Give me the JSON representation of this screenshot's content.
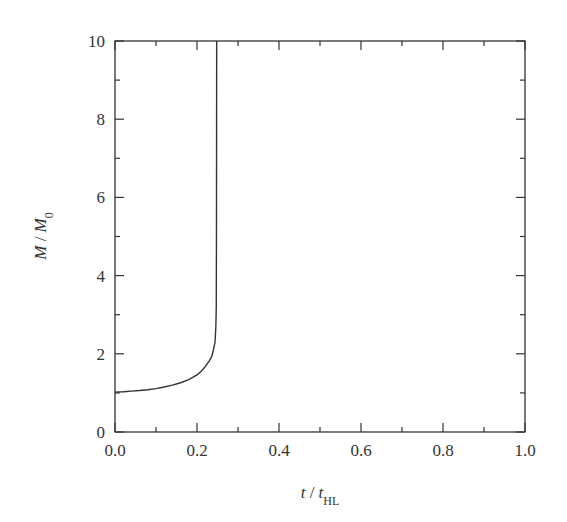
{
  "chart_data": {
    "type": "line",
    "title": "",
    "xlabel": "t / t_HL",
    "ylabel": "M / M_0",
    "xlabel_parts": {
      "var": "t",
      "sep": " / ",
      "var2": "t",
      "sub2": "HL"
    },
    "ylabel_parts": {
      "var": "M",
      "sep": " / ",
      "var2": "M",
      "sub2": "0"
    },
    "xlim": [
      0.0,
      1.0
    ],
    "ylim": [
      0,
      10
    ],
    "x_ticks": [
      0.0,
      0.2,
      0.4,
      0.6,
      0.8,
      1.0
    ],
    "x_tick_labels": [
      "0.0",
      "0.2",
      "0.4",
      "0.6",
      "0.8",
      "1.0"
    ],
    "x_minor_ticks": [
      0.1,
      0.3,
      0.5,
      0.7,
      0.9
    ],
    "y_ticks": [
      0,
      2,
      4,
      6,
      8,
      10
    ],
    "y_tick_labels": [
      "0",
      "2",
      "4",
      "6",
      "8",
      "10"
    ],
    "y_minor_ticks": [
      1,
      3,
      5,
      7,
      9
    ],
    "grid": false,
    "legend": null,
    "series": [
      {
        "name": "M/M0",
        "x": [
          0.0,
          0.02,
          0.04,
          0.06,
          0.08,
          0.1,
          0.12,
          0.14,
          0.16,
          0.18,
          0.2,
          0.21,
          0.22,
          0.23,
          0.236,
          0.24,
          0.244,
          0.246,
          0.247,
          0.2475,
          0.248
        ],
        "values": [
          1.02,
          1.03,
          1.045,
          1.06,
          1.08,
          1.11,
          1.15,
          1.2,
          1.26,
          1.34,
          1.46,
          1.55,
          1.67,
          1.82,
          1.93,
          2.1,
          2.3,
          2.7,
          3.2,
          5.0,
          10.0
        ]
      }
    ],
    "colors": {
      "line": "#333333",
      "frame": "#333333",
      "background": "#ffffff"
    }
  }
}
